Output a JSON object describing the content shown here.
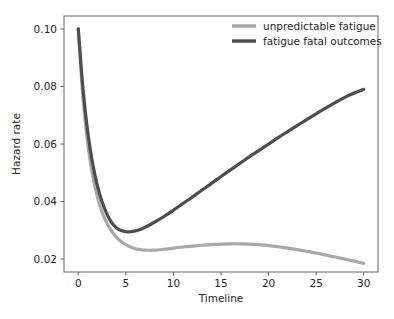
{
  "chart_data": {
    "type": "line",
    "title": "",
    "xlabel": "Timeline",
    "ylabel": "Hazard rate",
    "xlim": [
      -1.5,
      31.5
    ],
    "ylim": [
      0.0155,
      0.1045
    ],
    "xticks": [
      0,
      5,
      10,
      15,
      20,
      25,
      30
    ],
    "xtick_labels": [
      "0",
      "5",
      "10",
      "15",
      "20",
      "25",
      "30"
    ],
    "yticks": [
      0.02,
      0.04,
      0.06,
      0.08,
      0.1
    ],
    "ytick_labels": [
      "0.02",
      "0.04",
      "0.06",
      "0.08",
      "0.10"
    ],
    "grid": false,
    "legend_position": "upper right",
    "x": [
      0,
      0.5,
      1,
      1.5,
      2,
      2.5,
      3,
      3.5,
      4,
      4.5,
      5,
      5.5,
      6,
      6.5,
      7,
      8,
      9,
      10,
      11,
      12,
      13,
      14,
      15,
      16,
      17,
      18,
      19,
      20,
      21,
      22,
      23,
      24,
      25,
      26,
      27,
      28,
      29,
      30
    ],
    "series": [
      {
        "name": "unpredictable fatigue",
        "color": "#a8a8a8",
        "linewidth": 3.2,
        "values": [
          0.1,
          0.076,
          0.06,
          0.0492,
          0.0417,
          0.0363,
          0.0325,
          0.0297,
          0.0276,
          0.0261,
          0.025,
          0.0242,
          0.0236,
          0.0233,
          0.0231,
          0.0231,
          0.0234,
          0.0238,
          0.0242,
          0.0245,
          0.0248,
          0.025,
          0.0252,
          0.0253,
          0.0253,
          0.0252,
          0.025,
          0.0247,
          0.0243,
          0.0238,
          0.0233,
          0.0227,
          0.0221,
          0.0214,
          0.0207,
          0.02,
          0.0193,
          0.0185
        ]
      },
      {
        "name": "fatigue fatal outcomes",
        "color": "#4d4d4d",
        "linewidth": 3.2,
        "values": [
          0.1,
          0.079,
          0.064,
          0.0534,
          0.0456,
          0.0399,
          0.0357,
          0.0327,
          0.0309,
          0.0299,
          0.0295,
          0.0295,
          0.0298,
          0.0303,
          0.031,
          0.0328,
          0.0348,
          0.037,
          0.0393,
          0.0416,
          0.044,
          0.0463,
          0.0487,
          0.051,
          0.0533,
          0.0556,
          0.0578,
          0.06,
          0.0622,
          0.0643,
          0.0664,
          0.0685,
          0.0705,
          0.0725,
          0.0744,
          0.0762,
          0.0777,
          0.079
        ]
      }
    ]
  },
  "legend": {
    "entries": [
      {
        "label": "unpredictable fatigue",
        "color": "#a8a8a8"
      },
      {
        "label": "fatigue fatal outcomes",
        "color": "#4d4d4d"
      }
    ]
  },
  "axes": {
    "x_axis_title": "Timeline",
    "y_axis_title": "Hazard rate"
  }
}
